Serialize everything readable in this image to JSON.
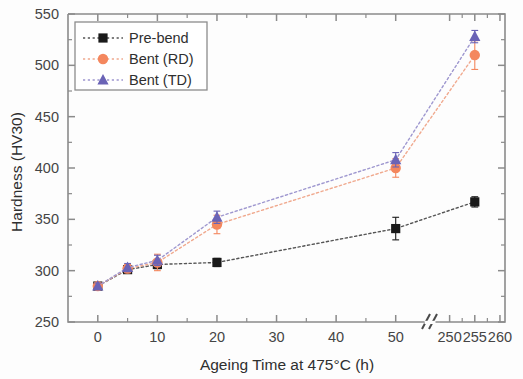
{
  "chart_data": {
    "type": "scatter",
    "title": "",
    "xlabel": "Ageing Time at 475°C (h)",
    "ylabel": "Hardness (HV30)",
    "ylim": [
      250,
      550
    ],
    "y_ticks": [
      250,
      300,
      350,
      400,
      450,
      500,
      550
    ],
    "y_minor_step": 25,
    "x_ticks_labels": [
      "0",
      "10",
      "20",
      "30",
      "40",
      "50",
      "250",
      "255",
      "260"
    ],
    "x_segment_1": {
      "min": -5,
      "max": 55,
      "ticks": [
        0,
        10,
        20,
        30,
        40,
        50
      ],
      "minor_step": 5
    },
    "x_segment_2": {
      "min": 247,
      "max": 261,
      "ticks": [
        250,
        255,
        260
      ],
      "minor_step": 2.5
    },
    "axis_break": true,
    "grid": false,
    "legend_position": "top-left",
    "series": [
      {
        "name": "Pre-bend",
        "marker": "square",
        "color": "#1a1a1a",
        "line_color": "#555555",
        "x": [
          0,
          5,
          10,
          20,
          50,
          255
        ],
        "values": [
          285,
          301,
          306,
          308,
          341,
          367
        ],
        "errors": [
          3,
          3,
          4,
          4,
          11,
          5
        ]
      },
      {
        "name": "Bent (RD)",
        "marker": "circle",
        "color": "#f4875e",
        "line_color": "#f0a98e",
        "x": [
          0,
          5,
          10,
          20,
          50,
          255
        ],
        "values": [
          285,
          302,
          308,
          345,
          400,
          510
        ],
        "errors": [
          3,
          4,
          8,
          9,
          9,
          14
        ]
      },
      {
        "name": "Bent (TD)",
        "marker": "triangle",
        "color": "#6a63b6",
        "line_color": "#9e97cf",
        "x": [
          0,
          5,
          10,
          20,
          50,
          255
        ],
        "values": [
          285,
          303,
          310,
          352,
          408,
          528
        ],
        "errors": [
          3,
          4,
          5,
          6,
          7,
          6
        ]
      }
    ]
  },
  "legend": {
    "items": [
      {
        "label": "Pre-bend"
      },
      {
        "label": "Bent (RD)"
      },
      {
        "label": "Bent (TD)"
      }
    ]
  }
}
